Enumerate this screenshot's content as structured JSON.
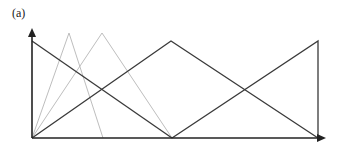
{
  "figure": {
    "panel_label": "(a)",
    "colors": {
      "bold": "#3a3a3a",
      "thin": "#b5b5b5",
      "axis": "#222222"
    },
    "axes": {
      "origin": [
        32,
        138
      ],
      "x_end": [
        326,
        138
      ],
      "y_end": [
        32,
        28
      ]
    },
    "bold_lines": [
      {
        "name": "left-shoulder-descending",
        "points": [
          [
            32,
            41
          ],
          [
            172,
            138
          ]
        ]
      },
      {
        "name": "center-triangle",
        "points": [
          [
            32,
            138
          ],
          [
            171,
            41
          ],
          [
            318,
            138
          ]
        ]
      },
      {
        "name": "right-shoulder-rising",
        "points": [
          [
            172,
            138
          ],
          [
            318,
            41
          ],
          [
            318,
            138
          ]
        ]
      }
    ],
    "thin_lines": [
      {
        "name": "thin-triangle-1",
        "points": [
          [
            32,
            138
          ],
          [
            69,
            33
          ],
          [
            103,
            138
          ]
        ]
      },
      {
        "name": "thin-triangle-2",
        "points": [
          [
            32,
            138
          ],
          [
            102,
            33
          ],
          [
            172,
            138
          ]
        ]
      }
    ]
  }
}
